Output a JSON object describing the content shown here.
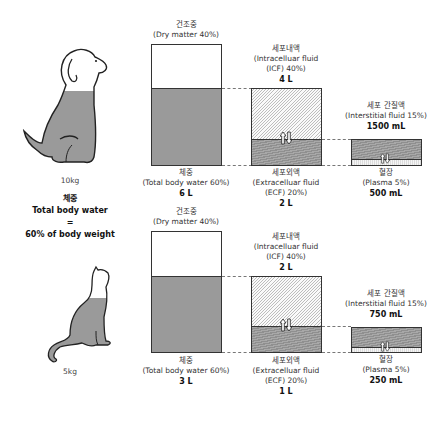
{
  "animals": [
    {
      "name": "dog",
      "weight": "10kg",
      "compartments": {
        "dry_matter": {
          "ko": "건조중",
          "en": "(Dry matter 40%)"
        },
        "total_body_water": {
          "ko": "체중",
          "en": "(Total body water 60%)",
          "value": "6 L"
        },
        "icf": {
          "ko": "세포내액",
          "en1": "(Intracelluar fluid",
          "en2": "(ICF) 40%)",
          "value": "4 L"
        },
        "ecf": {
          "ko": "세포외액",
          "en1": "(Extracelluar fluid",
          "en2": "(ECF) 20%)",
          "value": "2 L"
        },
        "interstitial": {
          "ko": "세포 간질액",
          "en": "(Interstitial fluid 15%)",
          "value": "1500 mL"
        },
        "plasma": {
          "ko": "혈장",
          "en": "(Plasma 5%)",
          "value": "500 mL"
        }
      }
    },
    {
      "name": "cat",
      "weight": "5kg",
      "compartments": {
        "dry_matter": {
          "ko": "건조중",
          "en": "(Dry matter 40%)"
        },
        "total_body_water": {
          "ko": "체중",
          "en": "(Total body water 60%)",
          "value": "3 L"
        },
        "icf": {
          "ko": "세포내액",
          "en1": "(Intracelluar fluid",
          "en2": "(ICF) 40%)",
          "value": "2 L"
        },
        "ecf": {
          "ko": "세포외액",
          "en1": "(Extracelluar fluid",
          "en2": "(ECF) 20%)",
          "value": "1 L"
        },
        "interstitial": {
          "ko": "세포 간질액",
          "en": "(Interstitial fluid 15%)",
          "value": "750 mL"
        },
        "plasma": {
          "ko": "혈장",
          "en": "(Plasma 5%)",
          "value": "250 mL"
        }
      }
    }
  ],
  "caption": {
    "ko": "체중",
    "line1": "Total body water",
    "line2": "=",
    "line3": "60% of body weight"
  },
  "icons": {
    "exchange": "up-down-arrows-icon"
  },
  "colors": {
    "water_gray": "#9a9a9a",
    "outline": "#333333",
    "hatch": "#bdbdbd"
  }
}
